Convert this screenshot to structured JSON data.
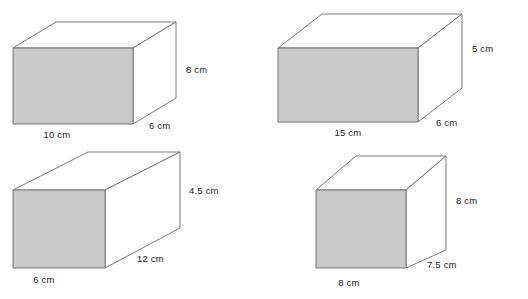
{
  "page": {
    "background_color": "#ffffff",
    "figure_count": 4,
    "shade_color": "#c9c9c9",
    "edge_color": "#6b6b6b",
    "hidden_edge_color": "#a8a8a8",
    "label_color": "#1a1a1a"
  },
  "prisms": [
    {
      "id": "prism-1",
      "position": "top-left",
      "shape": "rectangular-prism",
      "labels": {
        "height": "8 cm",
        "width": "10 cm",
        "depth": "6 cm"
      },
      "dimensions": {
        "height_value": 8,
        "width_value": 10,
        "depth_value": 6,
        "unit": "cm"
      }
    },
    {
      "id": "prism-2",
      "position": "top-right",
      "shape": "rectangular-prism",
      "labels": {
        "height": "5 cm",
        "width": "15 cm",
        "depth": "6 cm"
      },
      "dimensions": {
        "height_value": 5,
        "width_value": 15,
        "depth_value": 6,
        "unit": "cm"
      }
    },
    {
      "id": "prism-3",
      "position": "bottom-left",
      "shape": "rectangular-prism",
      "labels": {
        "height": "4.5 cm",
        "width": "6 cm",
        "depth": "12 cm"
      },
      "dimensions": {
        "height_value": 4.5,
        "width_value": 6,
        "depth_value": 12,
        "unit": "cm"
      }
    },
    {
      "id": "prism-4",
      "position": "bottom-right",
      "shape": "rectangular-prism",
      "labels": {
        "height": "8 cm",
        "width": "8 cm",
        "depth": "7.5 cm"
      },
      "dimensions": {
        "height_value": 8,
        "width_value": 8,
        "depth_value": 7.5,
        "unit": "cm"
      }
    }
  ]
}
